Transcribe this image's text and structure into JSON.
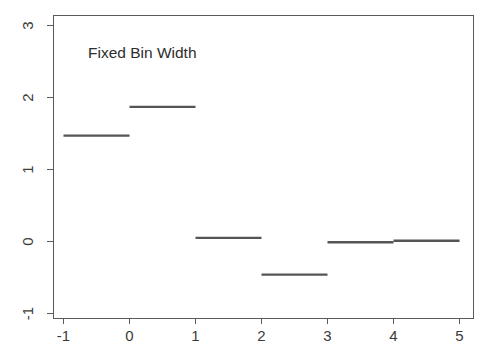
{
  "chart_data": {
    "type": "line",
    "title": "Fixed Bin Width",
    "xlabel": "",
    "ylabel": "",
    "xlim": [
      -1,
      5
    ],
    "ylim": [
      -1,
      3
    ],
    "grid": false,
    "legend": null,
    "x_ticks": [
      -1,
      0,
      1,
      2,
      3,
      4,
      5
    ],
    "x_tick_labels": [
      "-1",
      "0",
      "1",
      "2",
      "3",
      "4",
      "5"
    ],
    "y_ticks": [
      -1,
      0,
      1,
      2,
      3
    ],
    "y_tick_labels": [
      "-1",
      "0",
      "1",
      "2",
      "3"
    ],
    "series": [
      {
        "name": "regressogram",
        "style": "step-constant",
        "color": "#555555",
        "bins": [
          {
            "x_start": -1,
            "x_end": 0,
            "value": 1.47
          },
          {
            "x_start": 0,
            "x_end": 1,
            "value": 1.87
          },
          {
            "x_start": 1,
            "x_end": 2,
            "value": 0.05
          },
          {
            "x_start": 2,
            "x_end": 3,
            "value": -0.46
          },
          {
            "x_start": 3,
            "x_end": 4,
            "value": -0.01
          },
          {
            "x_start": 4,
            "x_end": 5,
            "value": 0.01
          }
        ]
      }
    ]
  },
  "annotations": {
    "title_label": "Fixed Bin Width"
  },
  "colors": {
    "line": "#555555",
    "axis": "#5a5a5a",
    "text": "#3b3b3b",
    "background": "#ffffff"
  }
}
